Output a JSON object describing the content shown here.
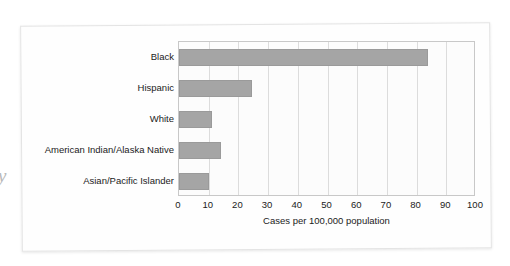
{
  "figure": {
    "margin_glyph": "y",
    "background_color": "#ffffff",
    "frame_color": "#e4e4e4"
  },
  "chart_data": {
    "type": "bar",
    "orientation": "horizontal",
    "title": "",
    "subtitle": "",
    "xlabel": "Cases per 100,000 population",
    "ylabel": "",
    "categories": [
      "Black",
      "Hispanic",
      "White",
      "American Indian/Alaska Native",
      "Asian/Pacific Islander"
    ],
    "values": [
      84,
      24.5,
      11,
      14,
      10
    ],
    "xlim": [
      0,
      100
    ],
    "xticks": [
      0,
      10,
      20,
      30,
      40,
      50,
      60,
      70,
      80,
      90,
      100
    ],
    "xtick_labels": [
      "0",
      "10",
      "20",
      "30",
      "40",
      "50",
      "60",
      "70",
      "80",
      "90",
      "100"
    ],
    "grid": true,
    "grid_axis": "x",
    "legend": false,
    "legend_position": "none",
    "bar_color": "#a5a5a5",
    "grid_color": "#dcdcdc",
    "plot_background": "#fcfcfc",
    "axis_color": "#c8c8c8"
  }
}
